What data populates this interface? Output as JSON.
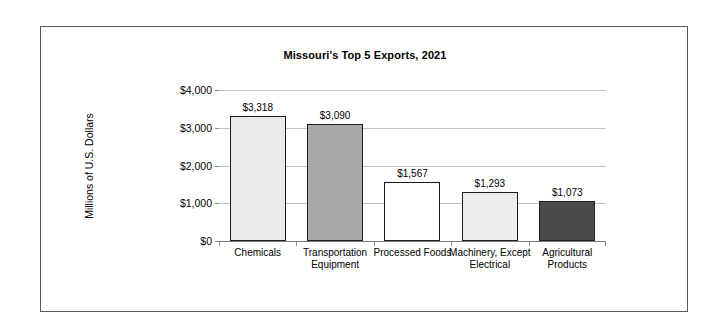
{
  "chart_data": {
    "type": "bar",
    "title": "Missouri's Top 5 Exports, 2021",
    "xlabel": "",
    "ylabel": "Millions of U.S. Dollars",
    "categories": [
      "Chemicals",
      "Transportation Equipment",
      "Processed Foods",
      "Machinery, Except Electrical",
      "Agricultural Products"
    ],
    "values": [
      3318,
      3090,
      1567,
      1293,
      1073
    ],
    "value_labels": [
      "$3,318",
      "$3,090",
      "$1,567",
      "$1,293",
      "$1,073"
    ],
    "bar_colors": [
      "#e9e9e9",
      "#a9a9a9",
      "#ffffff",
      "#ececec",
      "#4a4a4a"
    ],
    "bar_border_color": "#1d1d1d",
    "ylim": [
      0,
      4000
    ],
    "ytick_values": [
      0,
      1000,
      2000,
      3000,
      4000
    ],
    "ytick_labels": [
      "$0",
      "$1,000",
      "$2,000",
      "$3,000",
      "$4,000"
    ],
    "grid": true,
    "grid_axis": "y",
    "grid_color": "#c4c4c4",
    "legend": false,
    "legend_position": "none",
    "frame_border_color": "#5a5a5a",
    "background_color": "#ffffff"
  }
}
